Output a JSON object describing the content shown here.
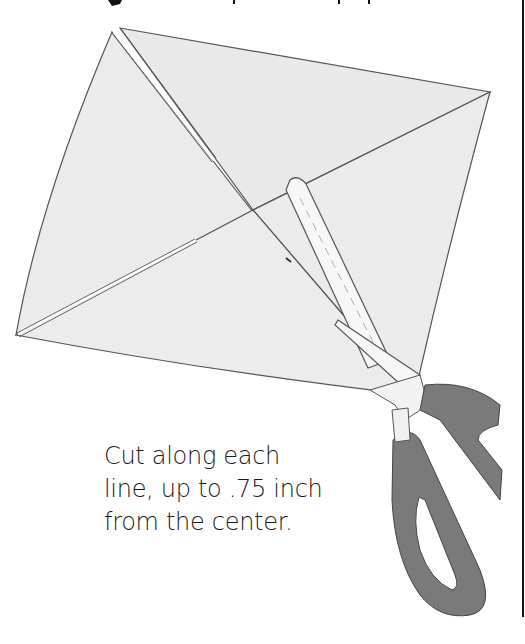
{
  "illustration": {
    "subject": "square paper with diagonal cuts and scissors",
    "title_cropped": true,
    "caption_lines": [
      "Cut along each",
      "line, up to .75 inch",
      "from the center."
    ],
    "colors": {
      "paper": "#ebebeb",
      "outline": "#555555",
      "scissor_blade": "#f7f7f7",
      "scissor_handle": "#7a7a7a",
      "text": "#1a1a1a",
      "border": "#111111"
    }
  }
}
